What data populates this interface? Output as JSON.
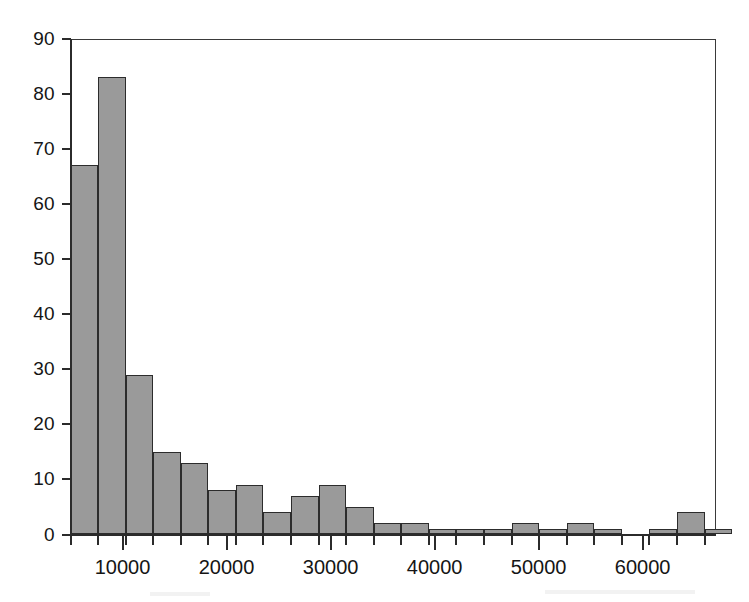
{
  "chart_data": {
    "type": "bar",
    "title": "",
    "subtitle": "",
    "xlabel": "",
    "ylabel": "",
    "grid": false,
    "legend": null,
    "xlim": [
      5000,
      67000
    ],
    "ylim": [
      0,
      90
    ],
    "bin_width": 2650,
    "x_tick_labels": [
      "10000",
      "20000",
      "30000",
      "40000",
      "50000",
      "60000"
    ],
    "x_tick_values": [
      10000,
      20000,
      30000,
      40000,
      50000,
      60000
    ],
    "x_minor_tick_step": 2650,
    "y_tick_labels": [
      "0",
      "10",
      "20",
      "30",
      "40",
      "50",
      "60",
      "70",
      "80",
      "90"
    ],
    "y_tick_values": [
      0,
      10,
      20,
      30,
      40,
      50,
      60,
      70,
      80,
      90
    ],
    "bin_starts": [
      5000,
      7650,
      10300,
      12950,
      15600,
      18250,
      20900,
      23550,
      26200,
      28850,
      31500,
      34150,
      36800,
      39450,
      42100,
      44750,
      47400,
      50050,
      52700,
      55350,
      58000,
      60650,
      63300,
      65950
    ],
    "categories": [
      "5000-7650",
      "7650-10300",
      "10300-12950",
      "12950-15600",
      "15600-18250",
      "18250-20900",
      "20900-23550",
      "23550-26200",
      "26200-28850",
      "28850-31500",
      "31500-34150",
      "34150-36800",
      "36800-39450",
      "39450-42100",
      "42100-44750",
      "44750-47400",
      "47400-50050",
      "50050-52700",
      "52700-55350",
      "55350-58000",
      "58000-60650",
      "60650-63300",
      "63300-65950",
      "65950-68600"
    ],
    "values": [
      67,
      83,
      29,
      15,
      13,
      8,
      9,
      4,
      7,
      9,
      5,
      2,
      2,
      1,
      1,
      1,
      2,
      1,
      2,
      1,
      0,
      1,
      4,
      1
    ],
    "bar_fill_color": "#9a9a9a",
    "bar_edge_color": "#2c2c2c",
    "axis_color": "#2b2b2b",
    "background_color": "#ffffff"
  }
}
